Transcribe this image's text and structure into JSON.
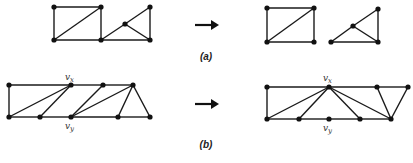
{
  "figure": {
    "panels": [
      {
        "id": "a",
        "label": "(a)",
        "label_pos": [
          206,
          60
        ],
        "arrow": {
          "x1": 195,
          "x2": 219,
          "y": 25
        },
        "before": {
          "nodes": [
            [
              54,
              7
            ],
            [
              101,
              7
            ],
            [
              54,
              40
            ],
            [
              101,
              40
            ],
            [
              125,
              24
            ],
            [
              150,
              7
            ],
            [
              150,
              40
            ]
          ],
          "edges": [
            [
              0,
              1
            ],
            [
              0,
              2
            ],
            [
              1,
              3
            ],
            [
              2,
              3
            ],
            [
              2,
              1
            ],
            [
              3,
              6
            ],
            [
              3,
              4
            ],
            [
              4,
              5
            ],
            [
              4,
              6
            ],
            [
              5,
              6
            ]
          ],
          "vertex_labels": []
        },
        "after": {
          "nodes": [
            [
              267,
              8
            ],
            [
              314,
              8
            ],
            [
              267,
              42
            ],
            [
              314,
              42
            ],
            [
              331,
              42
            ],
            [
              353,
              26
            ],
            [
              378,
              9
            ],
            [
              378,
              42
            ]
          ],
          "edges": [
            [
              0,
              1
            ],
            [
              0,
              2
            ],
            [
              1,
              3
            ],
            [
              2,
              3
            ],
            [
              2,
              1
            ],
            [
              4,
              7
            ],
            [
              4,
              5
            ],
            [
              5,
              6
            ],
            [
              5,
              7
            ],
            [
              6,
              7
            ]
          ],
          "vertex_labels": []
        }
      },
      {
        "id": "b",
        "label": "(b)",
        "label_pos": [
          206,
          148
        ],
        "arrow": {
          "x1": 195,
          "x2": 219,
          "y": 104
        },
        "before": {
          "nodes": [
            [
              9,
              85
            ],
            [
              71,
              85
            ],
            [
              103,
              85
            ],
            [
              133,
              85
            ],
            [
              9,
              117
            ],
            [
              40,
              117
            ],
            [
              71,
              117
            ],
            [
              118,
              117
            ],
            [
              150,
              117
            ]
          ],
          "edges": [
            [
              0,
              1
            ],
            [
              1,
              2
            ],
            [
              2,
              3
            ],
            [
              0,
              4
            ],
            [
              4,
              5
            ],
            [
              5,
              6
            ],
            [
              6,
              7
            ],
            [
              7,
              8
            ],
            [
              4,
              1
            ],
            [
              5,
              1
            ],
            [
              6,
              2
            ],
            [
              6,
              3
            ],
            [
              7,
              3
            ],
            [
              8,
              3
            ]
          ],
          "vertex_labels": [
            {
              "text": "v",
              "sub": "x",
              "x": 65,
              "y": 80
            },
            {
              "text": "v",
              "sub": "y",
              "x": 65,
              "y": 129
            }
          ]
        },
        "after": {
          "nodes": [
            [
              267,
              87
            ],
            [
              329,
              87
            ],
            [
              377,
              87
            ],
            [
              408,
              87
            ],
            [
              267,
              119
            ],
            [
              299,
              119
            ],
            [
              329,
              119
            ],
            [
              360,
              119
            ],
            [
              391,
              119
            ]
          ],
          "edges": [
            [
              0,
              1
            ],
            [
              1,
              2
            ],
            [
              2,
              3
            ],
            [
              0,
              4
            ],
            [
              4,
              5
            ],
            [
              5,
              6
            ],
            [
              6,
              7
            ],
            [
              7,
              8
            ],
            [
              1,
              4
            ],
            [
              1,
              5
            ],
            [
              1,
              7
            ],
            [
              1,
              8
            ],
            [
              2,
              8
            ],
            [
              3,
              8
            ]
          ],
          "vertex_labels": [
            {
              "text": "v",
              "sub": "x",
              "x": 323,
              "y": 81
            },
            {
              "text": "v",
              "sub": "y",
              "x": 323,
              "y": 131
            }
          ]
        }
      }
    ]
  }
}
